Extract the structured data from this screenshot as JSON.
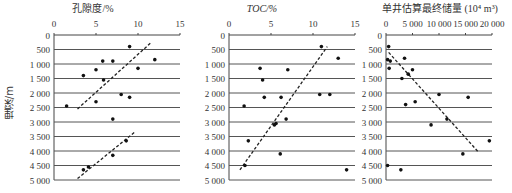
{
  "figure": {
    "ylabel": "埋深/m",
    "y_ticks": [
      "0",
      "500",
      "1 000",
      "1 500",
      "2 000",
      "2 500",
      "3 000",
      "3 500",
      "4 000",
      "4 500",
      "5 000"
    ]
  },
  "panels": [
    {
      "title": "孔隙度/%",
      "x_ticks": [
        "0",
        "5",
        "10",
        "15"
      ]
    },
    {
      "title": "TOC/%",
      "x_ticks": [
        "0",
        "5",
        "10",
        "15"
      ]
    },
    {
      "title": "单井估算最终储量 (10⁴ m³)",
      "x_ticks": [
        "0",
        "5 000",
        "10 000",
        "15 000",
        "20 000"
      ]
    }
  ],
  "chart_data": [
    {
      "type": "scatter",
      "title": "孔隙度/%",
      "xlabel": "孔隙度/%",
      "ylabel": "埋深/m",
      "xlim": [
        0,
        15
      ],
      "ylim": [
        5000,
        0
      ],
      "x_axis_position": "top",
      "grid": "horizontal",
      "points": [
        {
          "x": 9.0,
          "y": 400
        },
        {
          "x": 5.8,
          "y": 900
        },
        {
          "x": 7.0,
          "y": 900
        },
        {
          "x": 12.0,
          "y": 850
        },
        {
          "x": 5.0,
          "y": 1200
        },
        {
          "x": 10.0,
          "y": 1150
        },
        {
          "x": 3.5,
          "y": 1400
        },
        {
          "x": 5.9,
          "y": 1550
        },
        {
          "x": 8.0,
          "y": 2050
        },
        {
          "x": 9.0,
          "y": 2150
        },
        {
          "x": 1.5,
          "y": 2450
        },
        {
          "x": 5.0,
          "y": 2300
        },
        {
          "x": 7.0,
          "y": 2900
        },
        {
          "x": 8.6,
          "y": 3650
        },
        {
          "x": 7.0,
          "y": 4150
        },
        {
          "x": 4.1,
          "y": 4550
        },
        {
          "x": 3.5,
          "y": 4650
        }
      ],
      "trend_lines": [
        {
          "style": "dashed",
          "from": {
            "x": 2.8,
            "y": 2550
          },
          "to": {
            "x": 11.6,
            "y": 250
          }
        },
        {
          "style": "dashed",
          "from": {
            "x": 2.8,
            "y": 4950
          },
          "to": {
            "x": 9.6,
            "y": 3350
          }
        }
      ]
    },
    {
      "type": "scatter",
      "title": "TOC/%",
      "xlabel": "TOC/%",
      "ylabel": "埋深/m",
      "xlim": [
        0,
        15
      ],
      "ylim": [
        5000,
        0
      ],
      "x_axis_position": "top",
      "grid": "horizontal",
      "points": [
        {
          "x": 11.0,
          "y": 400
        },
        {
          "x": 13.0,
          "y": 800
        },
        {
          "x": 3.7,
          "y": 1150
        },
        {
          "x": 7.0,
          "y": 1200
        },
        {
          "x": 4.0,
          "y": 1550
        },
        {
          "x": 12.0,
          "y": 2050
        },
        {
          "x": 4.2,
          "y": 2150
        },
        {
          "x": 1.8,
          "y": 2450
        },
        {
          "x": 6.2,
          "y": 2150
        },
        {
          "x": 10.8,
          "y": 2050
        },
        {
          "x": 6.8,
          "y": 2900
        },
        {
          "x": 5.4,
          "y": 3100
        },
        {
          "x": 5.6,
          "y": 3050
        },
        {
          "x": 2.3,
          "y": 3650
        },
        {
          "x": 6.1,
          "y": 4100
        },
        {
          "x": 1.9,
          "y": 4500
        },
        {
          "x": 14.0,
          "y": 4650
        }
      ],
      "trend_lines": [
        {
          "style": "dashed",
          "from": {
            "x": 1.3,
            "y": 4650
          },
          "to": {
            "x": 11.7,
            "y": 400
          }
        }
      ]
    },
    {
      "type": "scatter",
      "title": "单井估算最终储量 (10⁴ m³)",
      "xlabel": "单井估算最终储量 (10⁴ m³)",
      "ylabel": "埋深/m",
      "xlim": [
        0,
        20000
      ],
      "ylim": [
        5000,
        0
      ],
      "x_axis_position": "top",
      "grid": "horizontal",
      "points": [
        {
          "x": 500,
          "y": 400
        },
        {
          "x": 300,
          "y": 850
        },
        {
          "x": 800,
          "y": 900
        },
        {
          "x": 3500,
          "y": 800
        },
        {
          "x": 600,
          "y": 1150
        },
        {
          "x": 5000,
          "y": 1200
        },
        {
          "x": 4200,
          "y": 1350
        },
        {
          "x": 3000,
          "y": 1500
        },
        {
          "x": 3700,
          "y": 2400
        },
        {
          "x": 5500,
          "y": 2300
        },
        {
          "x": 10000,
          "y": 2050
        },
        {
          "x": 15500,
          "y": 2150
        },
        {
          "x": 8500,
          "y": 3100
        },
        {
          "x": 11500,
          "y": 2900
        },
        {
          "x": 19500,
          "y": 3650
        },
        {
          "x": 14500,
          "y": 4100
        },
        {
          "x": 300,
          "y": 4500
        },
        {
          "x": 2800,
          "y": 4650
        }
      ],
      "trend_lines": [
        {
          "style": "dashed",
          "from": {
            "x": 500,
            "y": 600
          },
          "to": {
            "x": 17500,
            "y": 4050
          }
        }
      ]
    }
  ]
}
